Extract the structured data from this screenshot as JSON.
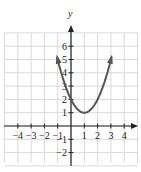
{
  "chart_data": {
    "type": "line",
    "title": "",
    "function": "y = x^2 - 2x + 2",
    "vertex": [
      1,
      1
    ],
    "xlabel": "",
    "ylabel": "y",
    "xlim": [
      -5,
      5
    ],
    "ylim": [
      -3,
      7
    ],
    "grid": true,
    "x_ticks": [
      -4,
      -3,
      -2,
      -1,
      1,
      2,
      3,
      4
    ],
    "y_ticks": [
      -2,
      -1,
      1,
      2,
      3,
      4,
      5,
      6
    ],
    "x_tick_labels": [
      "−4",
      "−3",
      "−2",
      "−1",
      "1",
      "2",
      "3",
      "4"
    ],
    "y_tick_labels": [
      "−2",
      "−1",
      "1",
      "2",
      "3",
      "4",
      "5",
      "6"
    ],
    "series": [
      {
        "name": "parabola",
        "x": [
          -1.1,
          -1,
          -0.5,
          0,
          0.5,
          1,
          1.5,
          2,
          2.5,
          3,
          3.5,
          3.6
        ],
        "y": [
          6.41,
          5,
          3.25,
          2,
          1.25,
          1,
          1.25,
          2,
          3.25,
          5,
          7.25,
          7.76
        ],
        "color": "#555555",
        "arrows_both_ends": true
      }
    ]
  },
  "style": {
    "grid_color": "#d9d9d9",
    "axis_color": "#222222",
    "curve_color": "#555555"
  }
}
